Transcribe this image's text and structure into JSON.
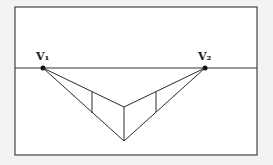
{
  "diagram": {
    "type": "two-point-perspective",
    "labels": {
      "v1": "V₁",
      "v2": "V₂"
    },
    "frame": {
      "x": 15,
      "y": 7,
      "width": 242,
      "height": 148
    },
    "horizon_y": 68,
    "vanishing_points": {
      "v1": {
        "x": 43,
        "y": 68
      },
      "v2": {
        "x": 205,
        "y": 68
      }
    },
    "front_edge": {
      "x": 124,
      "top": 107,
      "bottom": 141
    },
    "left_edge": {
      "x": 92,
      "top": 92,
      "bottom": 113
    },
    "right_edge": {
      "x": 156,
      "top": 92,
      "bottom": 112
    },
    "colors": {
      "stroke": "#2a2a2a",
      "frame_bg": "#ffffff",
      "page_bg": "#f3f3f3"
    }
  }
}
